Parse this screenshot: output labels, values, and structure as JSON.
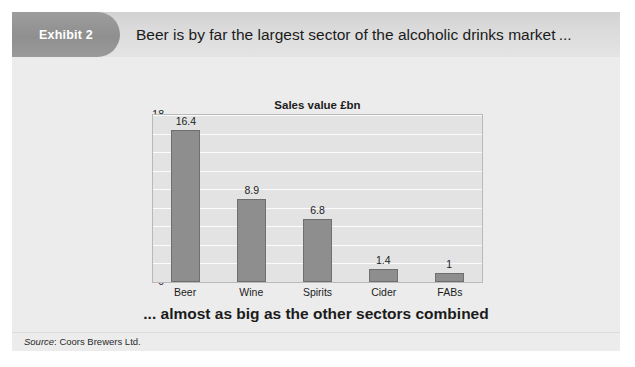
{
  "exhibit": {
    "badge_label": "Exhibit 2",
    "headline": "Beer is by far the largest sector of the alcoholic drinks market ...",
    "caption": "... almost as big as the other sectors combined",
    "source_prefix": "Source",
    "source_separator": ": ",
    "source_value": "Coors Brewers Ltd."
  },
  "colors": {
    "card_background": "#ebebeb",
    "header_gradient_top": "#d2d2d2",
    "header_gradient_bottom": "#e4e4e4",
    "badge_background": "#8f8f8f",
    "badge_text": "#ffffff",
    "plot_background": "#e3e3e3",
    "gridline": "#fbfbfb",
    "bar_fill": "#8e8e8e",
    "bar_border": "#6f6f6f",
    "text": "#1c1c1c"
  },
  "chart_data": {
    "type": "bar",
    "title": "Sales value £bn",
    "xlabel": "",
    "ylabel": "",
    "categories": [
      "Beer",
      "Wine",
      "Spirits",
      "Cider",
      "FABs"
    ],
    "values": [
      16.4,
      8.9,
      6.8,
      1.4,
      1
    ],
    "data_labels": [
      "16.4",
      "8.9",
      "6.8",
      "1.4",
      "1"
    ],
    "ylim": [
      0,
      18
    ],
    "y_ticks": [
      18,
      16,
      14,
      12,
      10,
      8,
      6,
      4,
      2,
      0
    ],
    "y_tick_labels": [
      "18",
      "16",
      "14",
      "12",
      "10",
      "8",
      "6",
      "4",
      "2",
      "0"
    ],
    "grid": true,
    "grid_axis": "y",
    "legend": false,
    "legend_position": "none",
    "orientation": "vertical"
  }
}
